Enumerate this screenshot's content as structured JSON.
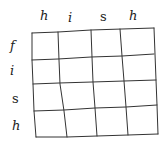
{
  "grid": {
    "rows": 4,
    "cols": 4,
    "column_headers": [
      "h",
      "i",
      "s",
      "h"
    ],
    "row_headers": [
      "f",
      "i",
      "s",
      "h"
    ],
    "line_color": "#333333"
  }
}
